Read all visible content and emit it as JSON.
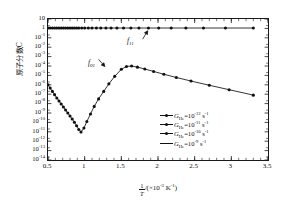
{
  "chart_data": {
    "type": "line",
    "title": "",
    "xlabel": "1/T /(×10-3 K-1)",
    "ylabel": "原子分数C",
    "xlim": [
      0.5,
      3.5
    ],
    "ylim_exponents": [
      -14,
      1
    ],
    "grid": false,
    "legend_position": "lower-right",
    "x_ticks": [
      "0.5",
      "1",
      "1.5",
      "2",
      "2.5",
      "3",
      "3.5"
    ],
    "x_tick_values": [
      0.5,
      1,
      1.5,
      2,
      2.5,
      3,
      3.5
    ],
    "y_ticks": [
      "10",
      "1",
      "10-1",
      "10-2",
      "10-3",
      "10-4",
      "10-5",
      "10-6",
      "10-7",
      "10-8",
      "10-9",
      "10-10",
      "10-11",
      "10-12",
      "10-13",
      "10-14"
    ],
    "y_tick_exponents": [
      1,
      0,
      -1,
      -2,
      -3,
      -4,
      -5,
      -6,
      -7,
      -8,
      -9,
      -10,
      -11,
      -12,
      -13,
      -14
    ],
    "annotations": [
      {
        "text": "f11",
        "x": 1.78,
        "y_exp": -0.9
      },
      {
        "text": "f01",
        "x": 1.12,
        "y_exp": -3.0
      }
    ],
    "series": [
      {
        "name": "f11",
        "marker": "filled-circle",
        "color": "#111111",
        "points": [
          {
            "x": 0.5,
            "y_exp": 0.04
          },
          {
            "x": 0.53,
            "y_exp": 0.04
          },
          {
            "x": 0.56,
            "y_exp": 0.04
          },
          {
            "x": 0.59,
            "y_exp": 0.04
          },
          {
            "x": 0.62,
            "y_exp": 0.04
          },
          {
            "x": 0.65,
            "y_exp": 0.04
          },
          {
            "x": 0.68,
            "y_exp": 0.04
          },
          {
            "x": 0.71,
            "y_exp": 0.04
          },
          {
            "x": 0.74,
            "y_exp": 0.04
          },
          {
            "x": 0.77,
            "y_exp": 0.04
          },
          {
            "x": 0.8,
            "y_exp": 0.04
          },
          {
            "x": 0.83,
            "y_exp": 0.04
          },
          {
            "x": 0.86,
            "y_exp": 0.04
          },
          {
            "x": 0.89,
            "y_exp": 0.04
          },
          {
            "x": 0.92,
            "y_exp": 0.04
          },
          {
            "x": 0.96,
            "y_exp": 0.04
          },
          {
            "x": 1.0,
            "y_exp": 0.04
          },
          {
            "x": 1.05,
            "y_exp": 0.04
          },
          {
            "x": 1.1,
            "y_exp": 0.04
          },
          {
            "x": 1.16,
            "y_exp": 0.04
          },
          {
            "x": 1.22,
            "y_exp": 0.04
          },
          {
            "x": 1.29,
            "y_exp": 0.04
          },
          {
            "x": 1.36,
            "y_exp": 0.04
          },
          {
            "x": 1.44,
            "y_exp": 0.04
          },
          {
            "x": 1.53,
            "y_exp": 0.04
          },
          {
            "x": 1.63,
            "y_exp": 0.04
          },
          {
            "x": 1.74,
            "y_exp": 0.04
          },
          {
            "x": 1.87,
            "y_exp": 0.04
          },
          {
            "x": 2.01,
            "y_exp": 0.04
          },
          {
            "x": 2.18,
            "y_exp": 0.04
          },
          {
            "x": 2.38,
            "y_exp": 0.04
          },
          {
            "x": 2.62,
            "y_exp": 0.04
          },
          {
            "x": 2.92,
            "y_exp": 0.04
          },
          {
            "x": 3.3,
            "y_exp": 0.04
          }
        ]
      },
      {
        "name": "f01",
        "marker": "filled-circle",
        "color": "#111111",
        "points": [
          {
            "x": 0.5,
            "y_exp": -6.0
          },
          {
            "x": 0.53,
            "y_exp": -6.35
          },
          {
            "x": 0.56,
            "y_exp": -6.7
          },
          {
            "x": 0.59,
            "y_exp": -7.05
          },
          {
            "x": 0.62,
            "y_exp": -7.4
          },
          {
            "x": 0.65,
            "y_exp": -7.72
          },
          {
            "x": 0.68,
            "y_exp": -8.04
          },
          {
            "x": 0.71,
            "y_exp": -8.36
          },
          {
            "x": 0.74,
            "y_exp": -8.68
          },
          {
            "x": 0.77,
            "y_exp": -9.0
          },
          {
            "x": 0.8,
            "y_exp": -9.32
          },
          {
            "x": 0.83,
            "y_exp": -9.64
          },
          {
            "x": 0.86,
            "y_exp": -9.98
          },
          {
            "x": 0.89,
            "y_exp": -10.35
          },
          {
            "x": 0.92,
            "y_exp": -10.75
          },
          {
            "x": 0.95,
            "y_exp": -11.02
          },
          {
            "x": 0.99,
            "y_exp": -10.6
          },
          {
            "x": 1.03,
            "y_exp": -9.9
          },
          {
            "x": 1.08,
            "y_exp": -9.1
          },
          {
            "x": 1.13,
            "y_exp": -8.3
          },
          {
            "x": 1.19,
            "y_exp": -7.5
          },
          {
            "x": 1.26,
            "y_exp": -6.7
          },
          {
            "x": 1.33,
            "y_exp": -5.9
          },
          {
            "x": 1.41,
            "y_exp": -5.1
          },
          {
            "x": 1.5,
            "y_exp": -4.35
          },
          {
            "x": 1.57,
            "y_exp": -4.05
          },
          {
            "x": 1.64,
            "y_exp": -4.0
          },
          {
            "x": 1.72,
            "y_exp": -4.12
          },
          {
            "x": 1.82,
            "y_exp": -4.32
          },
          {
            "x": 1.94,
            "y_exp": -4.58
          },
          {
            "x": 2.08,
            "y_exp": -4.88
          },
          {
            "x": 2.25,
            "y_exp": -5.22
          },
          {
            "x": 2.45,
            "y_exp": -5.6
          },
          {
            "x": 2.7,
            "y_exp": -6.05
          },
          {
            "x": 2.97,
            "y_exp": -6.52
          },
          {
            "x": 3.3,
            "y_exp": -7.1
          }
        ]
      }
    ],
    "legend_entries": [
      {
        "symbol_base": "G",
        "symbol_sub": "He",
        "eq": "=10",
        "exp": "-12",
        "unit": "s",
        "unit_exp": "-1",
        "marker": "filled-circle"
      },
      {
        "symbol_base": "G",
        "symbol_sub": "He",
        "eq": "=10",
        "exp": "-11",
        "unit": "s",
        "unit_exp": "-1",
        "marker": "filled-circle"
      },
      {
        "symbol_base": "G",
        "symbol_sub": "He",
        "eq": "=10",
        "exp": "-10",
        "unit": "s",
        "unit_exp": "-1",
        "marker": "filled-circle"
      },
      {
        "symbol_base": "G",
        "symbol_sub": "He",
        "eq": "=10",
        "exp": "-9",
        "unit": "s",
        "unit_exp": "-1",
        "marker": "line"
      }
    ]
  },
  "axes": {
    "y_title": "原子分数C",
    "x_title_num": "1",
    "x_title_den": "T",
    "x_title_rest_a": "/(×10",
    "x_title_exp_a": "-3",
    "x_title_rest_b": " K",
    "x_title_exp_b": "-1",
    "x_title_rest_c": ")"
  }
}
